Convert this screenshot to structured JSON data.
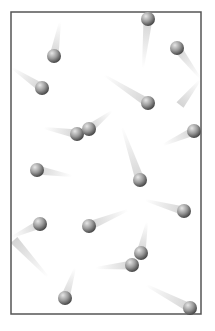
{
  "diagram": {
    "type": "gas-particles-in-container",
    "colors": {
      "border": "#555555",
      "ball_light": "#d8d8d8",
      "ball_dark": "#555555",
      "trail": "#cfcfcf",
      "background": "#ffffff"
    },
    "container": {
      "x": 11,
      "y": 12,
      "width": 190,
      "height": 302
    },
    "particles": [
      {
        "x": 54,
        "y": 56,
        "tx": 60,
        "ty": 22
      },
      {
        "x": 42,
        "y": 88,
        "tx": 12,
        "ty": 68
      },
      {
        "x": 148,
        "y": 19,
        "tx": 143,
        "ty": 68
      },
      {
        "x": 177,
        "y": 48,
        "tx": 200,
        "ty": 78
      },
      {
        "x": 148,
        "y": 103,
        "tx": 104,
        "ty": 75
      },
      {
        "x": 77,
        "y": 134,
        "tx": 44,
        "ty": 128
      },
      {
        "x": 89,
        "y": 129,
        "tx": 112,
        "ty": 111
      },
      {
        "x": 194,
        "y": 131,
        "tx": 163,
        "ty": 145
      },
      {
        "x": 140,
        "y": 180,
        "tx": 122,
        "ty": 127
      },
      {
        "x": 37,
        "y": 170,
        "tx": 72,
        "ty": 176
      },
      {
        "x": 184,
        "y": 211,
        "tx": 145,
        "ty": 200
      },
      {
        "x": 40,
        "y": 224,
        "tx": 12,
        "ty": 237
      },
      {
        "x": 89,
        "y": 226,
        "tx": 128,
        "ty": 210
      },
      {
        "x": 141,
        "y": 253,
        "tx": 147,
        "ty": 222
      },
      {
        "x": 132,
        "y": 265,
        "tx": 96,
        "ty": 268
      },
      {
        "x": 65,
        "y": 298,
        "tx": 75,
        "ty": 268
      },
      {
        "x": 190,
        "y": 308,
        "tx": 146,
        "ty": 285
      }
    ],
    "extra_trails": [
      {
        "x1": 14,
        "y1": 240,
        "x2": 48,
        "y2": 277
      },
      {
        "x1": 180,
        "y1": 105,
        "x2": 200,
        "y2": 80
      }
    ]
  }
}
